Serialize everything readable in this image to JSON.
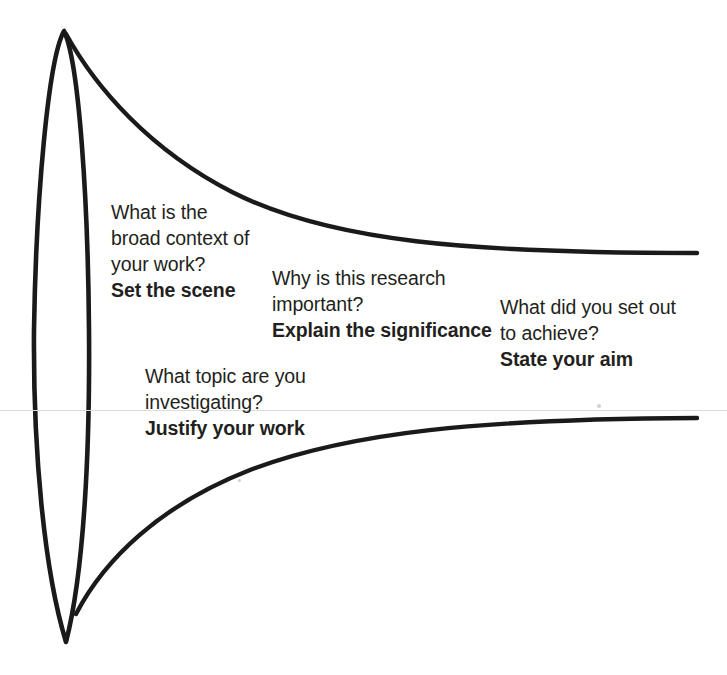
{
  "diagram": {
    "type": "funnel-diagram",
    "background_color": "#ffffff",
    "stroke_color": "#1a1a1a",
    "text_color": "#231f20"
  },
  "shapes": {
    "lens": {
      "name": "vertical-lens",
      "top_apex": {
        "x": 64,
        "y": 31
      },
      "bottom_apex": {
        "x": 66,
        "y": 642
      },
      "left_extreme_x": 34,
      "right_extreme_x": 90
    },
    "funnel_upper": {
      "name": "upper-funnel-curve",
      "start": {
        "x": 66,
        "y": 35
      },
      "end": {
        "x": 697,
        "y": 253
      }
    },
    "funnel_lower": {
      "name": "lower-funnel-curve",
      "start": {
        "x": 76,
        "y": 612
      },
      "end": {
        "x": 697,
        "y": 418
      }
    }
  },
  "annotations": [
    {
      "id": "set-the-scene",
      "name": "annotation-set-the-scene",
      "question_lines": [
        "What is the",
        "broad context of",
        "your work?"
      ],
      "answer": "Set the scene"
    },
    {
      "id": "justify-your-work",
      "name": "annotation-justify-your-work",
      "question_lines": [
        "What topic are you",
        "investigating?"
      ],
      "answer": "Justify your work"
    },
    {
      "id": "explain-the-significance",
      "name": "annotation-explain-the-significance",
      "question_lines": [
        "Why is this research",
        "important?"
      ],
      "answer": "Explain the significance"
    },
    {
      "id": "state-your-aim",
      "name": "annotation-state-your-aim",
      "question_lines": [
        "What did you set out",
        "to achieve?"
      ],
      "answer": "State your aim"
    }
  ]
}
